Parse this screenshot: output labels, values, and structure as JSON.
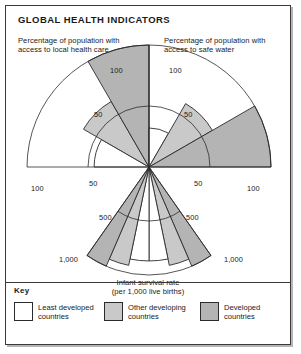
{
  "figure": {
    "title": "GLOBAL HEALTH INDICATORS"
  },
  "captions": {
    "health_care": "Percentage of population with access to local health care",
    "safe_water": "Percentage of population with access to safe water",
    "infant_line1": "Infant survival rate",
    "infant_line2": "(per 1,000 live births)"
  },
  "key": {
    "title": "Key",
    "items": [
      {
        "label": "Least developed\ncountries",
        "color": "#ffffff"
      },
      {
        "label": "Other developing\ncountries",
        "color": "#c9c9c9"
      },
      {
        "label": "Developed\ncountries",
        "color": "#b4b4b4"
      }
    ]
  },
  "ticks": {
    "health_top": "100",
    "health_mid": "50",
    "health_outer": "100",
    "health_outer_mid": "50",
    "water_top": "100",
    "water_mid": "50",
    "water_outer": "100",
    "water_outer_mid": "50",
    "infant_mid_left": "500",
    "infant_mid_right": "500",
    "infant_outer_left": "1,000",
    "infant_outer_right": "1,000"
  },
  "colors": {
    "least_developed": "#ffffff",
    "other_developing": "#c9c9c9",
    "developed": "#b4b4b4",
    "stroke": "#2b2b2b",
    "frame": "#3a3a3a"
  },
  "chart_data": {
    "type": "pie",
    "chart_subtype": "nightingale-rose-fan",
    "title": "GLOBAL HEALTH INDICATORS",
    "grid": true,
    "legend_position": "bottom",
    "center": {
      "x": 148,
      "y": 166
    },
    "series": [
      {
        "name": "Least developed countries",
        "color": "#ffffff"
      },
      {
        "name": "Other developing countries",
        "color": "#c9c9c9"
      },
      {
        "name": "Developed countries",
        "color": "#b4b4b4"
      }
    ],
    "panels": [
      {
        "name": "Percentage of population with access to local health care",
        "units": "percent",
        "axis_max": 100,
        "axis_ticks": [
          50,
          100
        ],
        "tick_labels": [
          "50",
          "100"
        ],
        "sector_start_deg": 180,
        "sector_end_deg": 270,
        "wedges": [
          {
            "category": "Least developed countries",
            "value": 45,
            "color": "#ffffff"
          },
          {
            "category": "Other developing countries",
            "value": 62,
            "color": "#c9c9c9"
          },
          {
            "category": "Developed countries",
            "value": 100,
            "color": "#b4b4b4"
          }
        ]
      },
      {
        "name": "Percentage of population with access to safe water",
        "units": "percent",
        "axis_max": 100,
        "axis_ticks": [
          50,
          100
        ],
        "tick_labels": [
          "50",
          "100"
        ],
        "sector_start_deg": 270,
        "sector_end_deg": 360,
        "wedges": [
          {
            "category": "Least developed countries",
            "value": 32,
            "color": "#ffffff"
          },
          {
            "category": "Other developing countries",
            "value": 60,
            "color": "#c9c9c9"
          },
          {
            "category": "Developed countries",
            "value": 100,
            "color": "#b4b4b4"
          }
        ]
      },
      {
        "name": "Infant survival rate (per 1,000 live births)",
        "units": "per 1,000 live births",
        "axis_max": 1000,
        "axis_ticks": [
          500,
          1000
        ],
        "tick_labels": [
          "500",
          "1,000"
        ],
        "sector_start_deg": 55,
        "sector_end_deg": 125,
        "wedges": [
          {
            "category": "Developed countries",
            "value": 1000,
            "color": "#b4b4b4"
          },
          {
            "category": "Other developing countries",
            "value": 930,
            "color": "#c9c9c9"
          },
          {
            "category": "Least developed countries",
            "value": 870,
            "color": "#ffffff"
          },
          {
            "category": "Least developed countries",
            "value": 870,
            "color": "#ffffff"
          },
          {
            "category": "Other developing countries",
            "value": 930,
            "color": "#c9c9c9"
          },
          {
            "category": "Developed countries",
            "value": 1000,
            "color": "#b4b4b4"
          }
        ]
      }
    ]
  }
}
